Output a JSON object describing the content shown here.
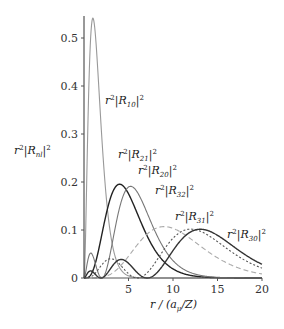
{
  "chart_data": {
    "type": "line",
    "title": "",
    "xlabel": "r/(a_μ/Z)",
    "ylabel": "r²|R_nl|²",
    "xlim": [
      0,
      20
    ],
    "ylim": [
      0,
      0.55
    ],
    "x_ticks": [
      "5",
      "10",
      "15",
      "20"
    ],
    "y_ticks": [
      "0",
      "0.1",
      "0.2",
      "0.3",
      "0.4",
      "0.5"
    ],
    "grid": false,
    "legend": "inline annotations",
    "series": [
      {
        "name": "r²|R10|²",
        "n": 1,
        "l": 0,
        "color": "#999999",
        "style": "solid",
        "peak": {
          "x": 1.0,
          "y": 0.54
        }
      },
      {
        "name": "r²|R21|²",
        "n": 2,
        "l": 1,
        "color": "#222222",
        "style": "solid",
        "peak": {
          "x": 4.0,
          "y": 0.195
        }
      },
      {
        "name": "r²|R20|²",
        "n": 2,
        "l": 0,
        "color": "#777777",
        "style": "solid",
        "peak": {
          "x": 5.24,
          "y": 0.19
        }
      },
      {
        "name": "r²|R32|²",
        "n": 3,
        "l": 2,
        "color": "#aaaaaa",
        "style": "dashed",
        "peak": {
          "x": 9.0,
          "y": 0.101
        }
      },
      {
        "name": "r²|R31|²",
        "n": 3,
        "l": 1,
        "color": "#555555",
        "style": "dotted",
        "peak": {
          "x": 12.0,
          "y": 0.095
        }
      },
      {
        "name": "r²|R30|²",
        "n": 3,
        "l": 0,
        "color": "#333333",
        "style": "solid",
        "peak": {
          "x": 13.07,
          "y": 0.1
        }
      }
    ]
  },
  "labels": {
    "ytitle_base": "r",
    "ytitle_sup": "2",
    "ytitle_R": "|R",
    "ytitle_sub": "nl",
    "ytitle_end": "|",
    "ytitle_sup2": "2",
    "xtitle": "r / (a",
    "xtitle_sub": "μ",
    "xtitle_end": "/Z)",
    "annotations": [
      {
        "sub": "10",
        "x": 105,
        "y": 104
      },
      {
        "sub": "21",
        "x": 118,
        "y": 158
      },
      {
        "sub": "20",
        "x": 138,
        "y": 174
      },
      {
        "sub": "32",
        "x": 155,
        "y": 194
      },
      {
        "sub": "31",
        "x": 175,
        "y": 220
      },
      {
        "sub": "30",
        "x": 227,
        "y": 238
      }
    ]
  }
}
